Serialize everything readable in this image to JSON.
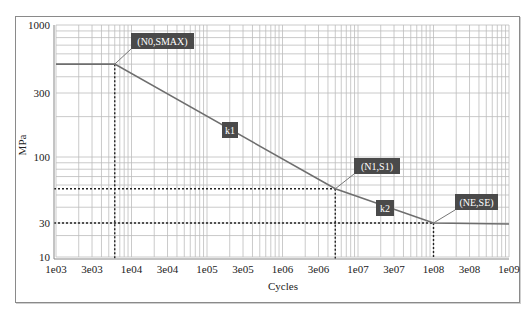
{
  "chart_data": {
    "type": "line",
    "title": "",
    "xlabel": "Cycles",
    "ylabel": "MPa",
    "xscale": "log",
    "yscale": "log",
    "xlim": [
      1000,
      1000000000
    ],
    "ylim": [
      10,
      1000
    ],
    "grid": true,
    "x_ticks": [
      "1e03",
      "3e03",
      "1e04",
      "3e04",
      "1e05",
      "3e05",
      "1e06",
      "3e06",
      "1e07",
      "3e07",
      "1e08",
      "3e08",
      "1e09"
    ],
    "y_ticks": [
      "1000",
      "300",
      "100",
      "30",
      "10"
    ],
    "series": [
      {
        "name": "S-N curve",
        "color": "#6e6e6e",
        "x": [
          1000,
          6000,
          5000000,
          100000000,
          1000000000
        ],
        "y": [
          500,
          500,
          56,
          30,
          29
        ]
      }
    ],
    "annotations": [
      {
        "label": "(N0,SMAX)",
        "x": 6000,
        "y": 500
      },
      {
        "label": "k1",
        "segment": "N0-N1"
      },
      {
        "label": "(N1,S1)",
        "x": 5000000,
        "y": 56
      },
      {
        "label": "k2",
        "segment": "N1-NE"
      },
      {
        "label": "(NE,SE)",
        "x": 100000000,
        "y": 30
      }
    ],
    "reference_lines": [
      {
        "type": "vertical",
        "x": 6000,
        "style": "dotted"
      },
      {
        "type": "vertical",
        "x": 5000000,
        "style": "dotted"
      },
      {
        "type": "vertical",
        "x": 100000000,
        "style": "dotted"
      },
      {
        "type": "horizontal",
        "y": 56,
        "style": "dotted"
      },
      {
        "type": "horizontal",
        "y": 30,
        "style": "dotted"
      }
    ]
  }
}
